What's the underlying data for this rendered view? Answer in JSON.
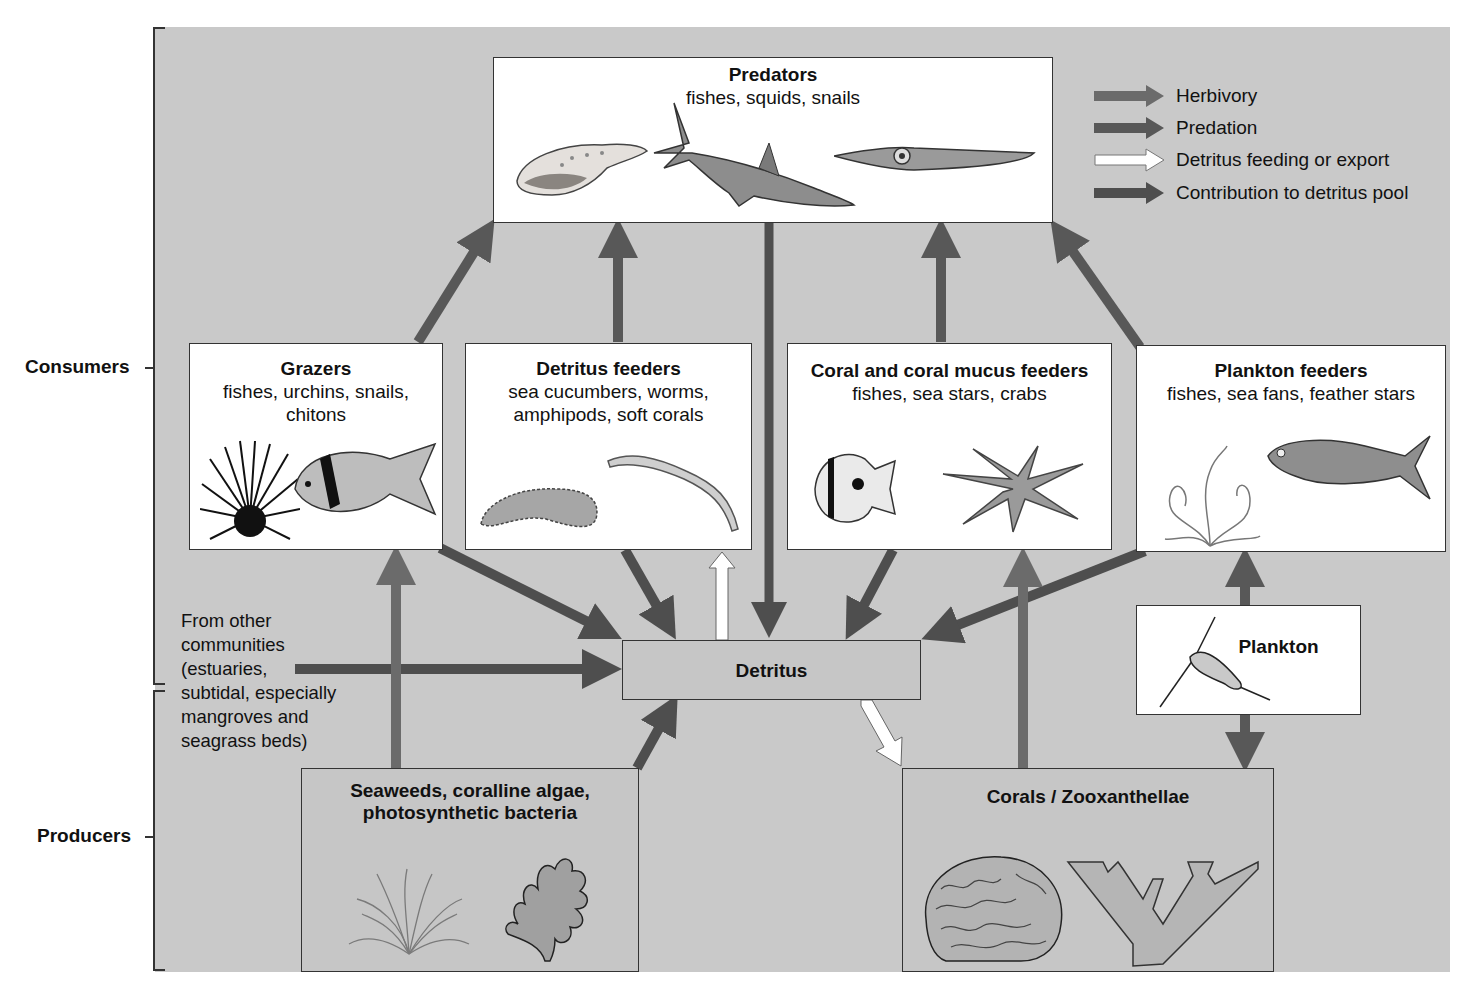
{
  "colors": {
    "background": "#c9c9c9",
    "box_white": "#ffffff",
    "box_gray": "#c6c6c6",
    "herbivory_arrow": "#6b6b6b",
    "predation_arrow": "#585858",
    "detritus_feeding_arrow": "#ffffff",
    "contribution_arrow": "#4e4e4e"
  },
  "side_labels": {
    "consumers": "Consumers",
    "producers": "Producers"
  },
  "legend": [
    {
      "label": "Herbivory",
      "style": "herbivory"
    },
    {
      "label": "Predation",
      "style": "predation"
    },
    {
      "label": "Detritus feeding or export",
      "style": "detritus-feeding"
    },
    {
      "label": "Contribution to detritus pool",
      "style": "contribution"
    }
  ],
  "boxes": {
    "predators": {
      "title": "Predators",
      "subtitle": "fishes, squids, snails",
      "icons": [
        "snail-shell-icon",
        "shark-icon",
        "squid-icon"
      ]
    },
    "grazers": {
      "title": "Grazers",
      "subtitle_line1": "fishes, urchins, snails,",
      "subtitle_line2": "chitons",
      "icons": [
        "sea-urchin-icon",
        "surgeonfish-icon"
      ]
    },
    "detritus_feeders": {
      "title": "Detritus feeders",
      "subtitle_line1": "sea cucumbers, worms,",
      "subtitle_line2": "amphipods, soft corals",
      "icons": [
        "sea-cucumber-icon",
        "worm-icon"
      ]
    },
    "coral_feeders": {
      "title": "Coral and coral mucus feeders",
      "subtitle": "fishes, sea stars, crabs",
      "icons": [
        "butterflyfish-icon",
        "crown-of-thorns-starfish-icon"
      ]
    },
    "plankton_feeders": {
      "title": "Plankton feeders",
      "subtitle": "fishes, sea fans, feather stars",
      "icons": [
        "feather-star-icon",
        "fish-icon"
      ]
    },
    "detritus": {
      "title": "Detritus"
    },
    "plankton": {
      "title": "Plankton",
      "icons": [
        "copepod-icon"
      ]
    },
    "seaweeds": {
      "title_line1": "Seaweeds, coralline algae,",
      "title_line2": "photosynthetic bacteria",
      "icons": [
        "seaweed-icon",
        "coralline-algae-icon"
      ]
    },
    "corals": {
      "title": "Corals / Zooxanthellae",
      "icons": [
        "brain-coral-icon",
        "branching-coral-icon"
      ]
    }
  },
  "external_source": {
    "lines": [
      "From other",
      "communities",
      "(estuaries,",
      "subtidal, especially",
      "mangroves and",
      "seagrass beds)"
    ]
  },
  "flows": [
    {
      "from": "grazers",
      "to": "predators",
      "type": "predation"
    },
    {
      "from": "detritus_feeders",
      "to": "predators",
      "type": "predation"
    },
    {
      "from": "coral_feeders",
      "to": "predators",
      "type": "predation"
    },
    {
      "from": "plankton_feeders",
      "to": "predators",
      "type": "predation"
    },
    {
      "from": "predators",
      "to": "detritus",
      "type": "contribution"
    },
    {
      "from": "grazers",
      "to": "detritus",
      "type": "contribution"
    },
    {
      "from": "detritus_feeders",
      "to": "detritus",
      "type": "contribution"
    },
    {
      "from": "coral_feeders",
      "to": "detritus",
      "type": "contribution"
    },
    {
      "from": "plankton_feeders",
      "to": "detritus",
      "type": "contribution"
    },
    {
      "from": "external_source",
      "to": "detritus",
      "type": "contribution"
    },
    {
      "from": "seaweeds",
      "to": "detritus",
      "type": "contribution"
    },
    {
      "from": "detritus",
      "to": "detritus_feeders",
      "type": "detritus-feeding"
    },
    {
      "from": "detritus",
      "to": "corals",
      "type": "detritus-feeding"
    },
    {
      "from": "seaweeds",
      "to": "grazers",
      "type": "herbivory"
    },
    {
      "from": "corals",
      "to": "coral_feeders",
      "type": "herbivory"
    },
    {
      "from": "plankton",
      "to": "plankton_feeders",
      "type": "predation"
    },
    {
      "from": "plankton",
      "to": "corals",
      "type": "predation"
    }
  ]
}
